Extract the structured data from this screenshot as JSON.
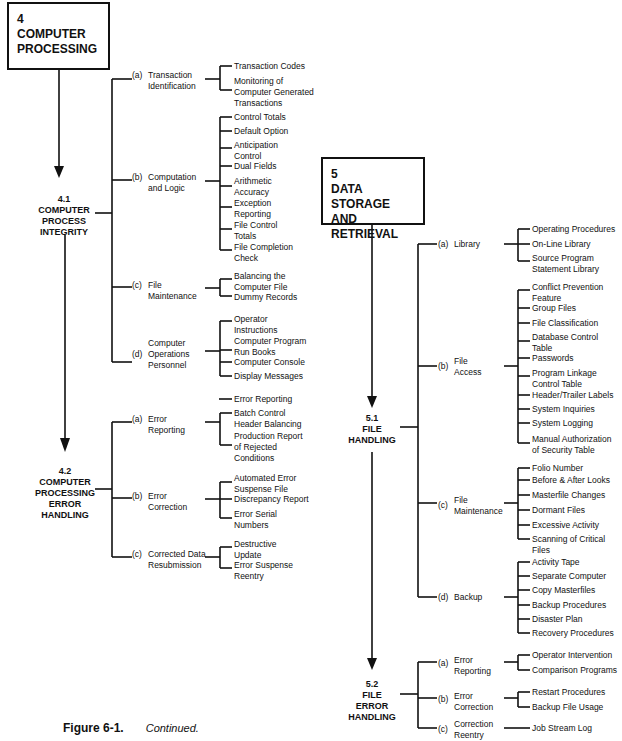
{
  "diagram": {
    "chapter4": {
      "number": "4",
      "title_line1": "COMPUTER",
      "title_line2": "PROCESSING",
      "sections": [
        {
          "number": "4.1",
          "lines": [
            "COMPUTER",
            "PROCESS",
            "INTEGRITY"
          ],
          "subs": [
            {
              "letter": "(a)",
              "label": "Transaction\nIdentification",
              "leaves": [
                "Transaction Codes",
                "Monitoring of\nComputer Generated\nTransactions"
              ]
            },
            {
              "letter": "(b)",
              "label": "Computation\nand Logic",
              "leaves": [
                "Control Totals",
                "Default Option",
                "Anticipation\nControl",
                "Dual Fields",
                "Arithmetic\nAccuracy",
                "Exception\nReporting",
                "File Control\nTotals",
                "File Completion\nCheck"
              ]
            },
            {
              "letter": "(c)",
              "label": "File\nMaintenance",
              "leaves": [
                "Balancing the\nComputer File",
                "Dummy Records"
              ]
            },
            {
              "letter": "(d)",
              "label": "Computer\nOperations\nPersonnel",
              "leaves": [
                "Operator\nInstructions",
                "Computer Program\nRun Books",
                "Computer Console",
                "Display Messages"
              ]
            }
          ]
        },
        {
          "number": "4.2",
          "lines": [
            "COMPUTER",
            "PROCESSING",
            "ERROR",
            "HANDLING"
          ],
          "subs": [
            {
              "letter": "(a)",
              "label": "Error\nReporting",
              "leaves": [
                "Error Reporting",
                "Batch Control\nHeader Balancing",
                "Production Report\nof Rejected\nConditions"
              ]
            },
            {
              "letter": "(b)",
              "label": "Error\nCorrection",
              "leaves": [
                "Automated Error\nSuspense File",
                "Discrepancy Report",
                "Error Serial\nNumbers"
              ]
            },
            {
              "letter": "(c)",
              "label": "Corrected Data\nResubmission",
              "leaves": [
                "Destructive\nUpdate",
                "Error Suspense\nReentry"
              ]
            }
          ]
        }
      ]
    },
    "chapter5": {
      "number": "5",
      "title_line1": "DATA",
      "title_line2": "STORAGE AND",
      "title_line3": "RETRIEVAL",
      "sections": [
        {
          "number": "5.1",
          "lines": [
            "FILE",
            "HANDLING"
          ],
          "subs": [
            {
              "letter": "(a)",
              "label": "Library",
              "leaves": [
                "Operating Procedures",
                "On-Line Library",
                "Source Program\nStatement Library"
              ]
            },
            {
              "letter": "(b)",
              "label": "File\nAccess",
              "leaves": [
                "Conflict Prevention\nFeature",
                "Group Files",
                "File Classification",
                "Database Control\nTable",
                "Passwords",
                "Program Linkage\nControl Table",
                "Header/Trailer Labels",
                "System Inquiries",
                "System Logging",
                "Manual Authorization\nof Security Table"
              ]
            },
            {
              "letter": "(c)",
              "label": "File\nMaintenance",
              "leaves": [
                "Folio Number",
                "Before & After Looks",
                "Masterfile Changes",
                "Dormant Files",
                "Excessive Activity",
                "Scanning of Critical Files"
              ]
            },
            {
              "letter": "(d)",
              "label": "Backup",
              "leaves": [
                "Activity Tape",
                "Separate Computer",
                "Copy Masterfiles",
                "Backup Procedures",
                "Disaster Plan",
                "Recovery Procedures"
              ]
            }
          ]
        },
        {
          "number": "5.2",
          "lines": [
            "FILE",
            "ERROR",
            "HANDLING"
          ],
          "subs": [
            {
              "letter": "(a)",
              "label": "Error\nReporting",
              "leaves": [
                "Operator Intervention",
                "Comparison Programs"
              ]
            },
            {
              "letter": "(b)",
              "label": "Error\nCorrection",
              "leaves": [
                "Restart Procedures",
                "Backup File Usage"
              ]
            },
            {
              "letter": "(c)",
              "label": "Correction\nReentry",
              "leaves": [
                "Job Stream Log"
              ]
            }
          ]
        }
      ]
    }
  },
  "caption": {
    "figure": "Figure 6-1.",
    "text": "Continued."
  }
}
